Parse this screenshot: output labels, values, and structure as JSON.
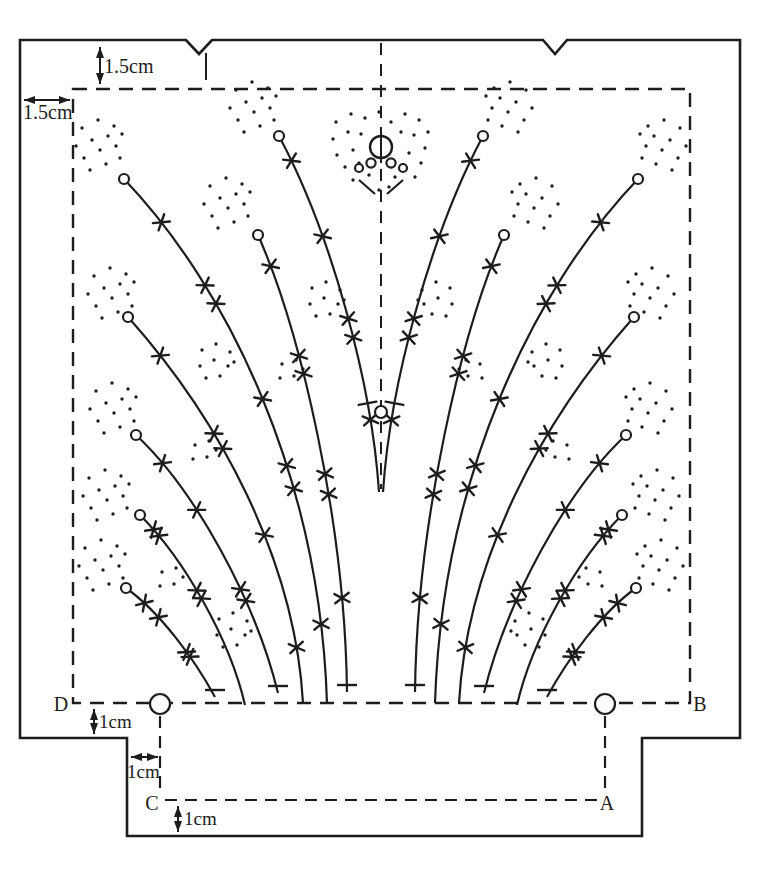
{
  "figure": {
    "canvas": {
      "w": 776,
      "h": 870
    },
    "ink": "#1d1d1d",
    "outline": {
      "d": "M20,40 L186,40 L199,54 L212,40 L543,40 L555,54 L567,40 L740,40 L740,738 L642,738 L642,836 L127,836 L127,738 L20,738 Z"
    },
    "seam_rect": {
      "d": "M73,89 L690,89 L690,703 L73,703 Z"
    },
    "center_line": {
      "x": 381,
      "y1": 43,
      "y2": 489
    },
    "aux_dashed": [
      {
        "x1": 165,
        "y1": 800,
        "x2": 597,
        "y2": 800
      },
      {
        "x1": 160,
        "y1": 716,
        "x2": 160,
        "y2": 796
      },
      {
        "x1": 605,
        "y1": 716,
        "x2": 605,
        "y2": 796
      }
    ],
    "extension_ticks": [
      {
        "x1": 206,
        "y1": 53,
        "x2": 206,
        "y2": 80
      }
    ],
    "line_circles": [
      {
        "cx": 160,
        "cy": 704,
        "r": 10
      },
      {
        "cx": 605,
        "cy": 704,
        "r": 10
      }
    ],
    "mirror_axis": 381,
    "curves": [
      {
        "tip": [
          279,
          136
        ],
        "c1": [
          332,
          235
        ],
        "c2": [
          372,
          385
        ],
        "end": [
          379,
          492
        ],
        "cap": "none",
        "marks": [
          {
            "t": 0.08,
            "type": "x"
          },
          {
            "t": 0.3,
            "type": "x"
          },
          {
            "t": 0.52,
            "type": "x"
          },
          {
            "t": 0.57,
            "type": "x"
          },
          {
            "t": 0.745,
            "type": "tick"
          },
          {
            "t": 0.79,
            "type": "x"
          }
        ]
      },
      {
        "tip": [
          258,
          235
        ],
        "c1": [
          300,
          330
        ],
        "c2": [
          345,
          520
        ],
        "end": [
          347,
          692
        ],
        "cap": "bar",
        "marks": [
          {
            "t": 0.1,
            "type": "x"
          },
          {
            "t": 0.33,
            "type": "x"
          },
          {
            "t": 0.37,
            "type": "x"
          },
          {
            "t": 0.58,
            "type": "x"
          },
          {
            "t": 0.62,
            "type": "x"
          },
          {
            "t": 0.82,
            "type": "x"
          }
        ]
      },
      {
        "tip": [
          124,
          179
        ],
        "c1": [
          230,
          290
        ],
        "c2": [
          320,
          480
        ],
        "end": [
          327,
          703
        ],
        "cap": "none",
        "marks": [
          {
            "t": 0.12,
            "type": "x"
          },
          {
            "t": 0.27,
            "type": "x"
          },
          {
            "t": 0.31,
            "type": "x"
          },
          {
            "t": 0.5,
            "type": "x"
          },
          {
            "t": 0.62,
            "type": "x"
          },
          {
            "t": 0.66,
            "type": "x"
          },
          {
            "t": 0.88,
            "type": "x"
          }
        ]
      },
      {
        "tip": [
          128,
          317
        ],
        "c1": [
          220,
          420
        ],
        "c2": [
          295,
          560
        ],
        "end": [
          303,
          703
        ],
        "cap": "none",
        "marks": [
          {
            "t": 0.12,
            "type": "x"
          },
          {
            "t": 0.34,
            "type": "x"
          },
          {
            "t": 0.38,
            "type": "x"
          },
          {
            "t": 0.6,
            "type": "x"
          },
          {
            "t": 0.87,
            "type": "x"
          }
        ]
      },
      {
        "tip": [
          136,
          435
        ],
        "c1": [
          195,
          490
        ],
        "c2": [
          255,
          600
        ],
        "end": [
          278,
          693
        ],
        "cap": "bar",
        "marks": [
          {
            "t": 0.15,
            "type": "x"
          },
          {
            "t": 0.35,
            "type": "x"
          },
          {
            "t": 0.64,
            "type": "x"
          },
          {
            "t": 0.68,
            "type": "x"
          }
        ]
      },
      {
        "tip": [
          140,
          515
        ],
        "c1": [
          185,
          560
        ],
        "c2": [
          230,
          640
        ],
        "end": [
          245,
          705
        ],
        "cap": "none",
        "marks": [
          {
            "t": 0.1,
            "type": "x"
          },
          {
            "t": 0.14,
            "type": "x"
          },
          {
            "t": 0.44,
            "type": "x"
          },
          {
            "t": 0.48,
            "type": "x"
          }
        ]
      },
      {
        "tip": [
          126,
          588
        ],
        "c1": [
          160,
          612
        ],
        "c2": [
          195,
          660
        ],
        "end": [
          215,
          697
        ],
        "cap": "bar",
        "marks": [
          {
            "t": 0.18,
            "type": "x"
          },
          {
            "t": 0.32,
            "type": "x"
          },
          {
            "t": 0.62,
            "type": "x"
          },
          {
            "t": 0.66,
            "type": "x"
          }
        ]
      }
    ],
    "tip_circle_r": 5,
    "clusters": [
      {
        "c": [
          108,
          150
        ],
        "p": "A"
      },
      {
        "c": [
          262,
          112
        ],
        "p": "A"
      },
      {
        "c": [
          236,
          208
        ],
        "p": "A"
      },
      {
        "c": [
          120,
          298
        ],
        "p": "A"
      },
      {
        "c": [
          122,
          413
        ],
        "p": "A"
      },
      {
        "c": [
          115,
          500
        ],
        "p": "A"
      },
      {
        "c": [
          111,
          570
        ],
        "p": "A"
      },
      {
        "c": [
          220,
          364
        ],
        "p": "B"
      },
      {
        "c": [
          330,
          302
        ],
        "p": "B"
      },
      {
        "c": [
          237,
          633
        ],
        "p": "B"
      },
      {
        "c": [
          205,
          455
        ],
        "p": "C"
      },
      {
        "c": [
          172,
          582
        ],
        "p": "C"
      },
      {
        "c": [
          292,
          374
        ],
        "p": "C"
      }
    ],
    "dot_patterns": {
      "A": [
        [
          -26,
          -22
        ],
        [
          -10,
          -30
        ],
        [
          6,
          -24
        ],
        [
          -32,
          -4
        ],
        [
          -16,
          -10
        ],
        [
          0,
          -14
        ],
        [
          14,
          -16
        ],
        [
          -24,
          8
        ],
        [
          -8,
          0
        ],
        [
          8,
          -4
        ],
        [
          -18,
          20
        ],
        [
          -2,
          14
        ],
        [
          12,
          8
        ]
      ],
      "B": [
        [
          -18,
          -14
        ],
        [
          -4,
          -20
        ],
        [
          10,
          -12
        ],
        [
          -20,
          2
        ],
        [
          -6,
          -4
        ],
        [
          8,
          2
        ],
        [
          -14,
          14
        ],
        [
          0,
          12
        ],
        [
          14,
          -2
        ]
      ],
      "C": [
        [
          -10,
          -10
        ],
        [
          4,
          -14
        ],
        [
          -12,
          4
        ],
        [
          2,
          2
        ],
        [
          11,
          -5
        ]
      ],
      "M": [
        [
          -45,
          -25
        ],
        [
          -30,
          -33
        ],
        [
          -16,
          -29
        ],
        [
          -2,
          -35
        ],
        [
          10,
          -25
        ],
        [
          24,
          -33
        ],
        [
          38,
          -27
        ],
        [
          47,
          -15
        ],
        [
          -48,
          -8
        ],
        [
          -33,
          -15
        ],
        [
          -20,
          -13
        ],
        [
          20,
          -15
        ],
        [
          33,
          -12
        ],
        [
          44,
          1
        ],
        [
          -44,
          8
        ],
        [
          -28,
          3
        ],
        [
          28,
          6
        ],
        [
          40,
          16
        ],
        [
          -36,
          20
        ],
        [
          -22,
          16
        ],
        [
          24,
          20
        ],
        [
          34,
          30
        ],
        [
          -28,
          33
        ],
        [
          -12,
          28
        ],
        [
          14,
          30
        ],
        [
          -2,
          43
        ],
        [
          8,
          40
        ]
      ]
    },
    "dot_r": 1.7,
    "top_motif": {
      "big_circle": {
        "cx": 381,
        "cy": 147,
        "r": 11
      },
      "axis_line": {
        "x1": 381,
        "y1": 131,
        "x2": 381,
        "y2": 163
      },
      "small_circles": [
        [
          359,
          168,
          4
        ],
        [
          371,
          163,
          4.6
        ],
        [
          391,
          163,
          4.6
        ],
        [
          403,
          168,
          4
        ]
      ],
      "stem_lines": [
        [
          359,
          180,
          375,
          194
        ],
        [
          403,
          180,
          387,
          194
        ]
      ],
      "spray_center": [
        381,
        147
      ],
      "spray_pattern": "M"
    },
    "mid_motif": {
      "circle": {
        "cx": 381,
        "cy": 412,
        "r": 6
      }
    },
    "dims": [
      {
        "id": "top-seam",
        "x1": 100,
        "y1": 47,
        "x2": 100,
        "y2": 84,
        "label": "1.5cm"
      },
      {
        "id": "left-seam",
        "x1": 24,
        "y1": 100,
        "x2": 70,
        "y2": 100,
        "label": "1.5cm"
      },
      {
        "id": "hem-left",
        "x1": 94,
        "y1": 709,
        "x2": 94,
        "y2": 734,
        "label": "1cm"
      },
      {
        "id": "step",
        "x1": 131,
        "y1": 757,
        "x2": 158,
        "y2": 757,
        "label": "1cm"
      },
      {
        "id": "hem-bottom",
        "x1": 178,
        "y1": 806,
        "x2": 178,
        "y2": 832,
        "label": "1cm"
      }
    ],
    "corners": [
      {
        "t": "D"
      },
      {
        "t": "B"
      },
      {
        "t": "C"
      },
      {
        "t": "A"
      }
    ]
  }
}
